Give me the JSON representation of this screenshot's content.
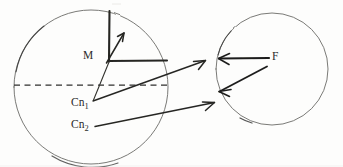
{
  "figure": {
    "kind": "hand-drawn-vector-diagram",
    "background_color": "#fdfdfc",
    "ink_color": "#2b2b2b",
    "outline_color": "#5a5a58",
    "width": 343,
    "height": 167
  },
  "labels": {
    "moment": "M",
    "contact_1_base": "Cn",
    "contact_1_sub": "1",
    "contact_2_base": "Cn",
    "contact_2_sub": "2",
    "force": "F"
  },
  "shapes": {
    "left_circle": {
      "cx": 91,
      "cy": 87,
      "r": 77,
      "name": "left-body-circle"
    },
    "right_circle": {
      "cx": 272,
      "cy": 69,
      "r": 56,
      "name": "right-body-circle"
    },
    "axis_dashed": {
      "x1": 14,
      "y1": 85,
      "x2": 167,
      "y2": 85,
      "name": "horizontal-axis-dashed"
    }
  },
  "vectors": [
    {
      "name": "moment-vertical-arm",
      "x1": 109,
      "y1": 12,
      "x2": 109,
      "y2": 61
    },
    {
      "name": "moment-horizontal-arm",
      "x1": 109,
      "y1": 61,
      "x2": 167,
      "y2": 61
    },
    {
      "name": "moment-diagonal-arrow",
      "x1": 107,
      "y1": 62,
      "x2": 124,
      "y2": 33
    },
    {
      "name": "contact1-force-arrow",
      "x1": 93,
      "y1": 101,
      "x2": 205,
      "y2": 61
    },
    {
      "name": "contact2-force-arrow",
      "x1": 95,
      "y1": 126,
      "x2": 214,
      "y2": 103
    },
    {
      "name": "contact1-radius-line",
      "x1": 93,
      "y1": 101,
      "x2": 109,
      "y2": 61
    },
    {
      "name": "force-left-arrow",
      "x1": 268,
      "y1": 58,
      "x2": 218,
      "y2": 58
    },
    {
      "name": "force-diagonal-arrow",
      "x1": 266,
      "y1": 67,
      "x2": 219,
      "y2": 92
    }
  ]
}
